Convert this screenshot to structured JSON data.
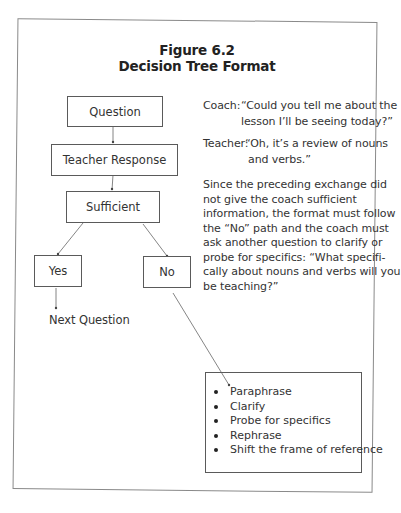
{
  "figure": {
    "number": "Figure 6.2",
    "title": "Decision Tree Format"
  },
  "tree": {
    "nodes": {
      "question": "Question",
      "teacher_response": "Teacher Response",
      "sufficient": "Sufficient",
      "yes": "Yes",
      "no": "No",
      "next_question": "Next Question"
    },
    "no_options": [
      "Paraphrase",
      "Clarify",
      "Probe for specifics",
      "Rephrase",
      "Shift the frame of reference"
    ]
  },
  "dialogue": {
    "coach_label": "Coach:",
    "coach_line1": "“Could you tell me about the",
    "coach_line2": "lesson I’ll be seeing today?”",
    "teacher_label": "Teacher:",
    "teacher_line1": "“Oh, it’s a review of nouns",
    "teacher_line2": "and verbs.”",
    "explanation_lines": [
      "Since the preceding exchange did",
      "not give the coach sufficient",
      "information, the format must follow",
      "the “No” path and the coach must",
      "ask another question to clarify or",
      "probe for specifics: “What specifi-",
      "cally about nouns and verbs will you",
      "be teaching?”"
    ]
  }
}
